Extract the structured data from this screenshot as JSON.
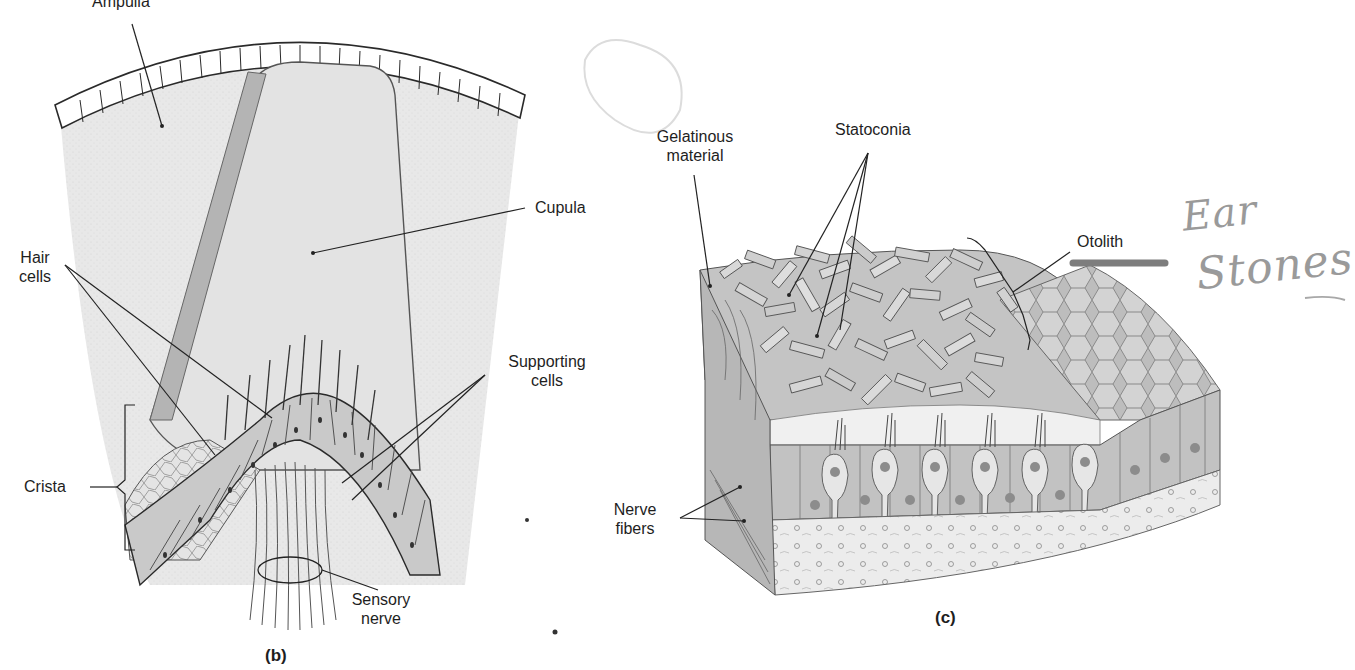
{
  "panels": {
    "b": {
      "label": "(b)",
      "title": "Crista ampullaris",
      "labels": {
        "ampulla": "Ampulla",
        "cupula": "Cupula",
        "hair_cells_line1": "Hair",
        "hair_cells_line2": "cells",
        "supporting_cells_line1": "Supporting",
        "supporting_cells_line2": "cells",
        "crista": "Crista",
        "sensory_nerve_line1": "Sensory",
        "sensory_nerve_line2": "nerve"
      }
    },
    "c": {
      "label": "(c)",
      "title": "Macula / otolith organ",
      "labels": {
        "gelatinous_line1": "Gelatinous",
        "gelatinous_line2": "material",
        "statoconia": "Statoconia",
        "otolith": "Otolith",
        "nerve_fibers_line1": "Nerve",
        "nerve_fibers_line2": "fibers"
      },
      "annotation": {
        "line1": "Ear",
        "line2": "Stones"
      }
    }
  },
  "colors": {
    "fluid": "#e9e9e9",
    "cupula_band": "#b4b4b4",
    "tissue": "#c9c9c9",
    "tissue_dark": "#9d9d9d",
    "line": "#2a2a2a",
    "pencil": "#9a9a9a"
  }
}
